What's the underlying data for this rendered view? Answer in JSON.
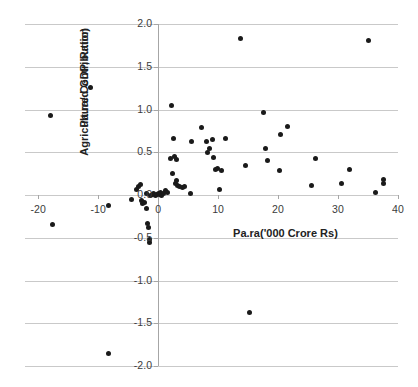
{
  "chart_data": {
    "type": "scatter",
    "title": "",
    "xlabel": "Pa.ra('000 Crore Rs)",
    "ylabel_line1": "Agriculture Contribution",
    "ylabel_line2": "Pa.ra/d GDP, Ratio)",
    "xlim": [
      -22.2,
      40
    ],
    "ylim": [
      -2.0,
      2.0
    ],
    "xticks": [
      -20,
      -10,
      0,
      10,
      20,
      30,
      40
    ],
    "xtick_labels": [
      "-20",
      "-10",
      "0",
      "10",
      "20",
      "30",
      "40"
    ],
    "yticks": [
      2.0,
      1.5,
      1.0,
      0.5,
      0.0,
      -0.5,
      -1.0,
      -1.5,
      -2.0
    ],
    "ytick_labels": [
      "2.0",
      "1.5",
      "1.0",
      "0.5",
      "0.0",
      "-0.5",
      "-1.0",
      "-1.5",
      "-2.0"
    ],
    "grid": true,
    "grid_axis": "y",
    "legend": false,
    "marker": "filled-circle",
    "marker_color": "#1a1a1a",
    "series": [
      {
        "name": "observations",
        "points": [
          [
            -18.0,
            0.93
          ],
          [
            -11.3,
            1.26
          ],
          [
            -17.6,
            -0.35
          ],
          [
            -8.3,
            -1.85
          ],
          [
            -8.2,
            -0.12
          ],
          [
            -4.4,
            -0.05
          ],
          [
            -3.6,
            0.06
          ],
          [
            -3.2,
            0.1
          ],
          [
            -3.0,
            0.12
          ],
          [
            -2.8,
            -0.07
          ],
          [
            -2.6,
            -0.1
          ],
          [
            -2.3,
            -0.09
          ],
          [
            -2.0,
            -0.16
          ],
          [
            -1.9,
            0.02
          ],
          [
            -1.7,
            -0.33
          ],
          [
            -1.6,
            -0.38
          ],
          [
            -1.5,
            -0.52
          ],
          [
            -1.4,
            -0.55
          ],
          [
            -1.2,
            0.0
          ],
          [
            -1.0,
            0.01
          ],
          [
            -0.7,
            0.02
          ],
          [
            -0.5,
            0.0
          ],
          [
            -0.3,
            0.01
          ],
          [
            0.0,
            0.02
          ],
          [
            0.2,
            0.01
          ],
          [
            0.4,
            0.03
          ],
          [
            0.6,
            0.0
          ],
          [
            0.9,
            0.02
          ],
          [
            1.2,
            0.05
          ],
          [
            1.6,
            0.03
          ],
          [
            2.0,
            0.43
          ],
          [
            2.2,
            1.05
          ],
          [
            2.4,
            0.25
          ],
          [
            2.6,
            0.66
          ],
          [
            2.8,
            0.45
          ],
          [
            2.9,
            0.14
          ],
          [
            3.0,
            0.17
          ],
          [
            3.1,
            0.42
          ],
          [
            3.2,
            0.11
          ],
          [
            3.6,
            0.1
          ],
          [
            4.1,
            0.09
          ],
          [
            4.4,
            0.1
          ],
          [
            5.4,
            0.02
          ],
          [
            5.6,
            0.62
          ],
          [
            7.2,
            0.79
          ],
          [
            8.0,
            0.63
          ],
          [
            8.2,
            0.5
          ],
          [
            8.6,
            0.54
          ],
          [
            9.0,
            0.65
          ],
          [
            9.3,
            0.44
          ],
          [
            9.6,
            0.3
          ],
          [
            9.9,
            0.31
          ],
          [
            10.3,
            0.07
          ],
          [
            10.6,
            0.29
          ],
          [
            11.2,
            0.66
          ],
          [
            13.8,
            1.83
          ],
          [
            14.6,
            0.35
          ],
          [
            15.2,
            -1.37
          ],
          [
            17.6,
            0.96
          ],
          [
            17.9,
            0.54
          ],
          [
            18.3,
            0.4
          ],
          [
            20.2,
            0.29
          ],
          [
            20.4,
            0.71
          ],
          [
            21.5,
            0.8
          ],
          [
            25.6,
            0.11
          ],
          [
            26.3,
            0.43
          ],
          [
            30.5,
            0.13
          ],
          [
            31.9,
            0.3
          ],
          [
            35.0,
            1.81
          ],
          [
            36.3,
            0.03
          ],
          [
            37.5,
            0.18
          ],
          [
            37.6,
            0.14
          ]
        ]
      }
    ]
  }
}
